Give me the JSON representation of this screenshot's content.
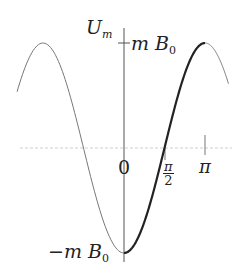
{
  "diagram": {
    "y_axis_label": {
      "main": "U",
      "sub": "m"
    },
    "max_label": {
      "pre": "m",
      "main": "B",
      "sub": "0"
    },
    "min_label": {
      "pre": "−m",
      "main": "B",
      "sub": "0"
    },
    "origin_label": "0",
    "x_ticks": [
      {
        "num": "π",
        "den": "2"
      },
      {
        "main": "π"
      }
    ]
  },
  "chart_data": {
    "type": "line",
    "title": "",
    "function": "U_m(θ) = −m B0 cos θ",
    "xlabel": "",
    "ylabel": "U_m",
    "x_tick_labels": [
      "0",
      "π/2",
      "π"
    ],
    "y_tick_labels": [
      "m B0",
      "−m B0"
    ],
    "xlim": [
      "-1.3π",
      "1.3π"
    ],
    "ylim": [
      -1,
      1
    ],
    "series": [
      {
        "name": "thin (outside [0, π])",
        "style": "thin",
        "x_range": [
          "-1.3π",
          "0"
        ],
        "note": "also (π, 1.3π]"
      },
      {
        "name": "thick (0 to π)",
        "style": "thick",
        "x_range": [
          "0",
          "π"
        ]
      }
    ],
    "key_points": [
      {
        "x": "-π",
        "y": 1
      },
      {
        "x": "0",
        "y": -1
      },
      {
        "x": "π/2",
        "y": 0
      },
      {
        "x": "π",
        "y": 1
      }
    ],
    "grid": false
  }
}
